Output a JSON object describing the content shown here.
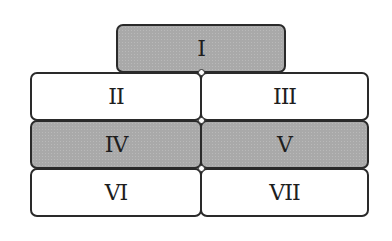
{
  "diagram": {
    "title": "",
    "boxes": [
      {
        "id": "I",
        "label": "I",
        "fill": "shaded",
        "row": 1,
        "col": "center"
      },
      {
        "id": "II",
        "label": "II",
        "fill": "white",
        "row": 2,
        "col": "left"
      },
      {
        "id": "III",
        "label": "III",
        "fill": "white",
        "row": 2,
        "col": "right"
      },
      {
        "id": "IV",
        "label": "IV",
        "fill": "shaded",
        "row": 3,
        "col": "left"
      },
      {
        "id": "V",
        "label": "V",
        "fill": "shaded",
        "row": 3,
        "col": "right"
      },
      {
        "id": "VI",
        "label": "VI",
        "fill": "white",
        "row": 4,
        "col": "left"
      },
      {
        "id": "VII",
        "label": "VII",
        "fill": "white",
        "row": 4,
        "col": "right"
      }
    ],
    "colors": {
      "shaded": "#a9a9a9",
      "white": "#ffffff",
      "border": "#2a2a2a"
    }
  }
}
